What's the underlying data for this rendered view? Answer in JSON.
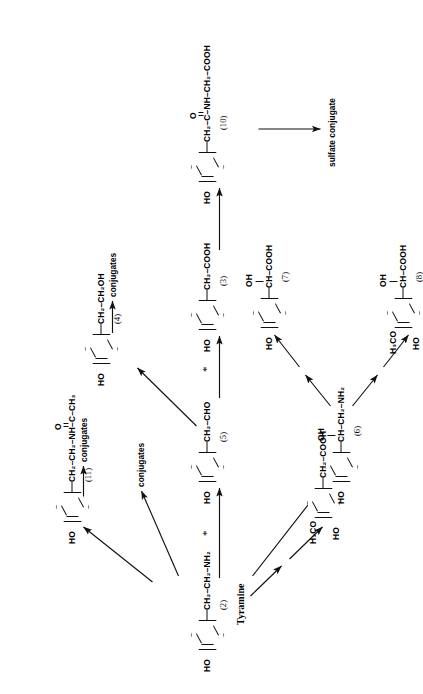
{
  "scheme": {
    "title": "Tyramine metabolic pathway scheme",
    "rotation_deg": -90,
    "footnote_marker": "*"
  },
  "compounds": [
    {
      "id": "2",
      "number": "(2)",
      "name": "Tyramine",
      "ring_left_label": "HO",
      "ring_substituents": [],
      "side_chain": "CH2-CH2-NH2",
      "side_chain_parts": [
        "CH",
        "2",
        "–CH",
        "2",
        "–NH",
        "2"
      ]
    },
    {
      "id": "11",
      "number": "(11)",
      "name": "",
      "ring_left_label": "HO",
      "side_chain": "CH2-CH2-NH-C(=O)-CH3",
      "carbonyl_label": "O",
      "terminal_label": "CH3"
    },
    {
      "id": "4",
      "number": "(4)",
      "name": "",
      "ring_left_label": "HO",
      "side_chain": "CH2-CH2OH"
    },
    {
      "id": "5",
      "number": "(5)",
      "name": "",
      "ring_left_label": "HO",
      "side_chain": "CH2-CHO"
    },
    {
      "id": "3",
      "number": "(3)",
      "name": "",
      "ring_left_label": "HO",
      "side_chain": "CH2-COOH"
    },
    {
      "id": "10",
      "number": "(10)",
      "name": "",
      "ring_left_label": "HO",
      "side_chain": "CH2-C(=O)-NH-CH2-COOH",
      "carbonyl_label": "O"
    },
    {
      "id": "6",
      "number": "(6)",
      "name": "",
      "ring_left_label": "HO",
      "hydroxy_label": "OH",
      "side_chain": "CH(OH)-CH2-NH2"
    },
    {
      "id": "7",
      "number": "(7)",
      "name": "",
      "ring_left_label": "HO",
      "hydroxy_label": "OH",
      "side_chain": "CH(OH)-COOH"
    },
    {
      "id": "8",
      "number": "(8)",
      "name": "",
      "ring_left_label": "HO",
      "ring_methoxy_label": "H3CO",
      "hydroxy_label": "OH",
      "side_chain": "CH(OH)-COOH"
    },
    {
      "id": "9",
      "number": "(9)",
      "name": "",
      "ring_left_label": "HO",
      "ring_methoxy_label": "H3CO",
      "side_chain": "CH2-COOH"
    }
  ],
  "labels": {
    "tyramine": "Tyramine",
    "num_2": "(2)",
    "num_3": "(3)",
    "num_4": "(4)",
    "num_5": "(5)",
    "num_6": "(6)",
    "num_7": "(7)",
    "num_8": "(8)",
    "num_9": "(9)",
    "num_10": "(10)",
    "num_11": "(11)",
    "conjugates_top": "conjugates",
    "conjugates_mid": "conjugates",
    "conjugates_right": "conjugates",
    "sulfate_conjugate": "sulfate conjugate",
    "ho": "HO",
    "oh": "OH",
    "h3co": "H₃CO",
    "o": "O",
    "ch3": "CH₃",
    "nh": "NH",
    "c": "C",
    "cho": "CHO",
    "cooh": "COOH",
    "ch2oh": "CH₂OH",
    "ch2": "CH₂",
    "ch": "CH",
    "nh2": "NH₂",
    "star": "*"
  },
  "chain_text": {
    "tyramine_chain": "CH₂–CH₂–NH₂",
    "c11_chain": "CH₂–CH₂–NH–C–CH₃",
    "c4_chain": "CH₂–CH₂OH",
    "c5_chain": "CH₂–CHO",
    "c3_chain": "CH₂–COOH",
    "c10_chain": "CH₂–C–NH–CH₂–COOH",
    "c6_chain": "CH–CH₂–NH₂",
    "c7_chain": "CH–COOH",
    "c8_chain": "CH–COOH",
    "c9_chain": "CH₂–COOH"
  },
  "colors": {
    "ink": "#111111",
    "paper": "#ffffff"
  }
}
